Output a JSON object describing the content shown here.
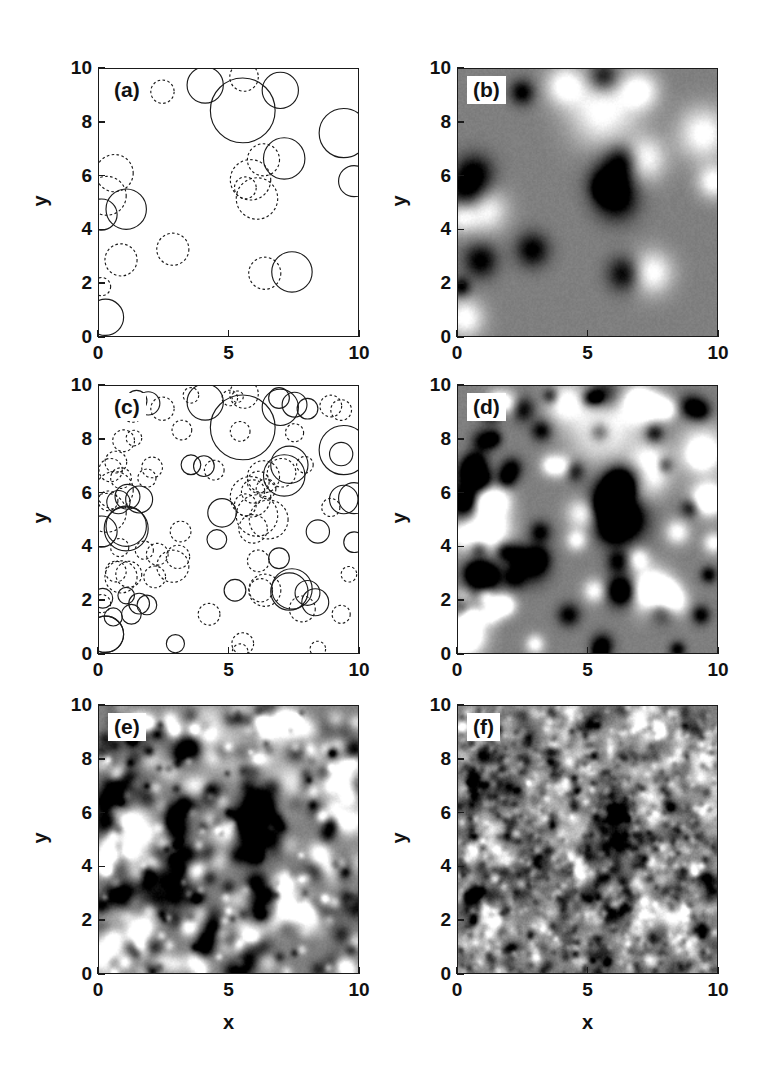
{
  "figure": {
    "layout": "2 columns x 3 rows of square panels",
    "background_color": "#ffffff",
    "axis_color": "#1a1a1a"
  },
  "axes": {
    "x_title": "x",
    "y_title": "y",
    "x_ticks": [
      "0",
      "5",
      "10"
    ],
    "x_tick_values": [
      0,
      5,
      10
    ],
    "y_ticks": [
      "0",
      "2",
      "4",
      "6",
      "8",
      "10"
    ],
    "y_tick_values": [
      0,
      2,
      4,
      6,
      8,
      10
    ],
    "xlim": [
      0,
      10
    ],
    "ylim": [
      0,
      10
    ]
  },
  "panels": [
    {
      "id": "a",
      "label": "(a)",
      "kind": "circles",
      "col": 0,
      "row": 0,
      "show_x_ticklabels": true,
      "show_y_ticklabels": true,
      "show_x_title": false,
      "show_y_title": true
    },
    {
      "id": "b",
      "label": "(b)",
      "kind": "field",
      "col": 1,
      "row": 0,
      "show_x_ticklabels": true,
      "show_y_ticklabels": true,
      "show_x_title": false,
      "show_y_title": true
    },
    {
      "id": "c",
      "label": "(c)",
      "kind": "circles",
      "col": 0,
      "row": 1,
      "show_x_ticklabels": true,
      "show_y_ticklabels": true,
      "show_x_title": false,
      "show_y_title": true
    },
    {
      "id": "d",
      "label": "(d)",
      "kind": "field",
      "col": 1,
      "row": 1,
      "show_x_ticklabels": true,
      "show_y_ticklabels": true,
      "show_x_title": false,
      "show_y_title": true
    },
    {
      "id": "e",
      "label": "(e)",
      "kind": "field",
      "col": 0,
      "row": 2,
      "show_x_ticklabels": true,
      "show_y_ticklabels": true,
      "show_x_title": true,
      "show_y_title": true
    },
    {
      "id": "f",
      "label": "(f)",
      "kind": "field",
      "col": 1,
      "row": 2,
      "show_x_ticklabels": true,
      "show_y_ticklabels": true,
      "show_x_title": true,
      "show_y_title": true
    }
  ],
  "chart_data": {
    "type": "scatter",
    "title": "",
    "xlabel": "x",
    "ylabel": "y",
    "xlim": [
      0,
      10
    ],
    "ylim": [
      0,
      10
    ],
    "grid": false,
    "legend": "none",
    "grayscale": {
      "background_level": 0.5,
      "min_color": "#000000",
      "mid_color": "#8a8a8a",
      "max_color": "#ffffff"
    },
    "series": [
      {
        "name": "panel_a_circles",
        "panel": "a",
        "count": 22,
        "fields": [
          "x",
          "y",
          "r",
          "sign"
        ],
        "points": [
          [
            2.45,
            9.15,
            0.45,
            -1
          ],
          [
            4.1,
            9.4,
            0.7,
            1
          ],
          [
            5.55,
            8.45,
            1.25,
            1
          ],
          [
            5.6,
            9.7,
            0.55,
            -1
          ],
          [
            7.0,
            9.2,
            0.7,
            1
          ],
          [
            9.45,
            7.6,
            0.95,
            1
          ],
          [
            9.85,
            5.8,
            0.6,
            1
          ],
          [
            7.15,
            6.65,
            0.8,
            1
          ],
          [
            6.35,
            6.6,
            0.62,
            -1
          ],
          [
            5.85,
            5.85,
            0.78,
            -1
          ],
          [
            5.65,
            5.55,
            0.42,
            -1
          ],
          [
            6.1,
            5.15,
            0.8,
            -1
          ],
          [
            0.6,
            6.1,
            0.72,
            -1
          ],
          [
            0.3,
            5.25,
            0.75,
            -1
          ],
          [
            1.05,
            4.75,
            0.78,
            1
          ],
          [
            0.1,
            4.55,
            0.6,
            1
          ],
          [
            0.85,
            2.85,
            0.62,
            -1
          ],
          [
            2.85,
            3.25,
            0.62,
            -1
          ],
          [
            6.4,
            2.35,
            0.62,
            -1
          ],
          [
            7.45,
            2.4,
            0.78,
            1
          ],
          [
            0.1,
            1.85,
            0.35,
            -1
          ],
          [
            0.25,
            0.7,
            0.7,
            1
          ]
        ]
      },
      {
        "name": "panel_c_circles",
        "panel": "c",
        "count": 96,
        "fields": [
          "x",
          "y",
          "r",
          "sign"
        ],
        "points": [
          [
            2.45,
            9.15,
            0.45,
            -1
          ],
          [
            4.1,
            9.4,
            0.7,
            1
          ],
          [
            5.55,
            8.45,
            1.25,
            1
          ],
          [
            5.6,
            9.7,
            0.55,
            -1
          ],
          [
            7.0,
            9.2,
            0.7,
            1
          ],
          [
            9.45,
            7.6,
            0.95,
            1
          ],
          [
            9.85,
            5.8,
            0.6,
            1
          ],
          [
            7.15,
            6.65,
            0.8,
            1
          ],
          [
            6.35,
            6.6,
            0.62,
            -1
          ],
          [
            5.85,
            5.85,
            0.78,
            -1
          ],
          [
            5.65,
            5.55,
            0.42,
            -1
          ],
          [
            6.1,
            5.15,
            0.8,
            -1
          ],
          [
            0.6,
            6.1,
            0.72,
            -1
          ],
          [
            0.3,
            5.25,
            0.75,
            -1
          ],
          [
            1.05,
            4.75,
            0.78,
            1
          ],
          [
            0.1,
            4.55,
            0.6,
            1
          ],
          [
            0.85,
            2.85,
            0.62,
            -1
          ],
          [
            2.85,
            3.25,
            0.62,
            -1
          ],
          [
            6.4,
            2.35,
            0.62,
            -1
          ],
          [
            7.45,
            2.4,
            0.78,
            1
          ],
          [
            0.1,
            1.85,
            0.35,
            -1
          ],
          [
            0.25,
            0.7,
            0.7,
            1
          ],
          [
            1.45,
            9.45,
            0.4,
            1
          ],
          [
            1.3,
            9.05,
            0.42,
            -1
          ],
          [
            1.9,
            9.35,
            0.45,
            1
          ],
          [
            3.55,
            9.65,
            0.3,
            -1
          ],
          [
            5.05,
            9.55,
            0.3,
            -1
          ],
          [
            5.35,
            9.6,
            0.22,
            -1
          ],
          [
            6.95,
            9.55,
            0.4,
            1
          ],
          [
            7.55,
            9.3,
            0.48,
            1
          ],
          [
            8.05,
            9.15,
            0.4,
            1
          ],
          [
            8.95,
            9.25,
            0.42,
            -1
          ],
          [
            9.35,
            9.1,
            0.4,
            -1
          ],
          [
            3.2,
            8.35,
            0.38,
            -1
          ],
          [
            5.45,
            8.3,
            0.38,
            -1
          ],
          [
            7.55,
            8.25,
            0.35,
            -1
          ],
          [
            0.95,
            7.95,
            0.42,
            -1
          ],
          [
            1.35,
            8.05,
            0.3,
            -1
          ],
          [
            9.35,
            7.45,
            0.45,
            1
          ],
          [
            7.95,
            7.05,
            0.32,
            -1
          ],
          [
            7.35,
            7.05,
            0.72,
            1
          ],
          [
            7.05,
            6.75,
            0.55,
            -1
          ],
          [
            3.55,
            7.05,
            0.38,
            1
          ],
          [
            4.05,
            7.0,
            0.4,
            1
          ],
          [
            4.45,
            6.85,
            0.38,
            -1
          ],
          [
            0.65,
            7.15,
            0.42,
            -1
          ],
          [
            0.45,
            6.85,
            0.45,
            -1
          ],
          [
            0.85,
            6.55,
            0.4,
            -1
          ],
          [
            6.15,
            6.4,
            0.42,
            -1
          ],
          [
            6.45,
            6.15,
            0.38,
            -1
          ],
          [
            5.95,
            6.05,
            0.45,
            -1
          ],
          [
            1.1,
            5.85,
            0.48,
            1
          ],
          [
            1.55,
            5.75,
            0.52,
            1
          ],
          [
            0.75,
            5.65,
            0.45,
            1
          ],
          [
            0.35,
            5.7,
            0.38,
            -1
          ],
          [
            9.45,
            5.75,
            0.55,
            1
          ],
          [
            8.95,
            5.45,
            0.35,
            -1
          ],
          [
            4.75,
            5.25,
            0.55,
            1
          ],
          [
            6.55,
            5.0,
            0.75,
            -1
          ],
          [
            5.95,
            4.65,
            0.55,
            -1
          ],
          [
            1.05,
            4.65,
            0.85,
            1
          ],
          [
            8.45,
            4.55,
            0.45,
            1
          ],
          [
            3.15,
            4.55,
            0.4,
            -1
          ],
          [
            4.55,
            4.25,
            0.38,
            1
          ],
          [
            9.85,
            4.15,
            0.4,
            1
          ],
          [
            0.8,
            3.95,
            0.35,
            -1
          ],
          [
            1.75,
            3.85,
            0.35,
            -1
          ],
          [
            2.25,
            3.7,
            0.42,
            -1
          ],
          [
            3.05,
            3.6,
            0.45,
            -1
          ],
          [
            6.15,
            3.45,
            0.42,
            -1
          ],
          [
            6.95,
            3.55,
            0.4,
            1
          ],
          [
            0.65,
            3.05,
            0.4,
            -1
          ],
          [
            1.15,
            2.95,
            0.5,
            -1
          ],
          [
            2.15,
            2.85,
            0.42,
            -1
          ],
          [
            5.25,
            2.35,
            0.42,
            1
          ],
          [
            6.25,
            2.35,
            0.45,
            -1
          ],
          [
            7.35,
            2.3,
            0.72,
            1
          ],
          [
            8.05,
            2.25,
            0.48,
            1
          ],
          [
            8.35,
            1.9,
            0.52,
            1
          ],
          [
            7.85,
            1.65,
            0.5,
            -1
          ],
          [
            0.15,
            2.05,
            0.38,
            1
          ],
          [
            1.05,
            2.15,
            0.32,
            1
          ],
          [
            1.55,
            1.85,
            0.4,
            1
          ],
          [
            1.85,
            1.8,
            0.38,
            1
          ],
          [
            1.25,
            1.45,
            0.38,
            1
          ],
          [
            0.55,
            1.35,
            0.35,
            1
          ],
          [
            4.25,
            1.45,
            0.42,
            -1
          ],
          [
            9.35,
            1.45,
            0.35,
            -1
          ],
          [
            2.95,
            0.35,
            0.35,
            1
          ],
          [
            5.55,
            0.35,
            0.42,
            -1
          ],
          [
            5.45,
            0.05,
            0.3,
            -1
          ],
          [
            8.45,
            0.15,
            0.3,
            -1
          ],
          [
            0.25,
            0.7,
            0.7,
            1
          ],
          [
            2.05,
            6.95,
            0.4,
            -1
          ],
          [
            1.85,
            6.55,
            0.35,
            -1
          ],
          [
            9.65,
            2.95,
            0.3,
            -1
          ]
        ]
      },
      {
        "name": "panel_b_field",
        "panel": "b",
        "source_count": 22,
        "note": "grayscale field from panel (a) circles"
      },
      {
        "name": "panel_d_field",
        "panel": "d",
        "source_count": 96,
        "note": "grayscale field from panel (c) circles"
      },
      {
        "name": "panel_e_field",
        "panel": "e",
        "source_count": 420,
        "note": "grayscale field, higher source density"
      },
      {
        "name": "panel_f_field",
        "panel": "f",
        "source_count": 1800,
        "note": "grayscale field, highest source density"
      }
    ]
  }
}
